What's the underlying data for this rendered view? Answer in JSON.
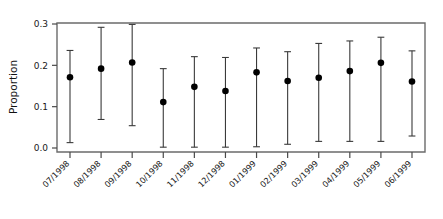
{
  "chart_data": {
    "type": "scatter",
    "title": "",
    "xlabel": "",
    "ylabel": "Proportion",
    "ylim": [
      0.0,
      0.3
    ],
    "yticks": [
      "0.0",
      "0.1",
      "0.2",
      "0.3"
    ],
    "ytick_values": [
      0.0,
      0.1,
      0.2,
      0.3
    ],
    "grid": false,
    "legend": "none",
    "error_bars": "asymmetric confidence intervals",
    "categories": [
      "07/1998",
      "08/1998",
      "09/1998",
      "10/1998",
      "11/1998",
      "12/1998",
      "01/1999",
      "02/1999",
      "03/1999",
      "04/1999",
      "05/1999",
      "06/1999"
    ],
    "values": [
      0.171,
      0.192,
      0.207,
      0.111,
      0.148,
      0.138,
      0.183,
      0.162,
      0.17,
      0.186,
      0.206,
      0.161
    ],
    "lower": [
      0.013,
      0.069,
      0.054,
      0.002,
      0.002,
      0.002,
      0.003,
      0.009,
      0.016,
      0.016,
      0.016,
      0.029
    ],
    "upper": [
      0.236,
      0.292,
      0.299,
      0.192,
      0.221,
      0.219,
      0.242,
      0.233,
      0.253,
      0.259,
      0.268,
      0.235
    ],
    "series": [
      {
        "name": "Proportion",
        "points": [
          {
            "x": "07/1998",
            "y": 0.171,
            "lo": 0.013,
            "hi": 0.236
          },
          {
            "x": "08/1998",
            "y": 0.192,
            "lo": 0.069,
            "hi": 0.292
          },
          {
            "x": "09/1998",
            "y": 0.207,
            "lo": 0.054,
            "hi": 0.299
          },
          {
            "x": "10/1998",
            "y": 0.111,
            "lo": 0.002,
            "hi": 0.192
          },
          {
            "x": "11/1998",
            "y": 0.148,
            "lo": 0.002,
            "hi": 0.221
          },
          {
            "x": "12/1998",
            "y": 0.138,
            "lo": 0.002,
            "hi": 0.219
          },
          {
            "x": "01/1999",
            "y": 0.183,
            "lo": 0.003,
            "hi": 0.242
          },
          {
            "x": "02/1999",
            "y": 0.162,
            "lo": 0.009,
            "hi": 0.233
          },
          {
            "x": "03/1999",
            "y": 0.17,
            "lo": 0.016,
            "hi": 0.253
          },
          {
            "x": "04/1999",
            "y": 0.186,
            "lo": 0.016,
            "hi": 0.259
          },
          {
            "x": "05/1999",
            "y": 0.206,
            "lo": 0.016,
            "hi": 0.268
          },
          {
            "x": "06/1999",
            "y": 0.161,
            "lo": 0.029,
            "hi": 0.235
          }
        ]
      }
    ],
    "colors": {
      "point": "#000000",
      "error_bar": "#3a3a3a",
      "frame": "#6b6b6b",
      "tick": "#4a4a4a",
      "text": "#1a1a1a",
      "background": "#ffffff"
    }
  }
}
